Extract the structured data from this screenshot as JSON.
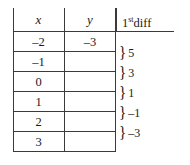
{
  "figure": {
    "name": "first-difference-table",
    "headers": {
      "x": "x",
      "y": "y",
      "diff_prefix": "1",
      "diff_sup": "st",
      "diff_suffix": "diff"
    },
    "rows": [
      {
        "x": "–2",
        "y": "–3"
      },
      {
        "x": "–1",
        "y": ""
      },
      {
        "x": "0",
        "y": ""
      },
      {
        "x": "1",
        "y": ""
      },
      {
        "x": "2",
        "y": ""
      },
      {
        "x": "3",
        "y": ""
      }
    ],
    "first_differences": [
      {
        "brace": "}",
        "value": "5"
      },
      {
        "brace": "}",
        "value": "3"
      },
      {
        "brace": "}",
        "value": "1"
      },
      {
        "brace": "}",
        "value": "–1"
      },
      {
        "brace": "}",
        "value": "–3"
      }
    ],
    "colors": {
      "rule": "#3a3a3a",
      "text": "#1a1a1a",
      "background": "#ffffff"
    }
  }
}
